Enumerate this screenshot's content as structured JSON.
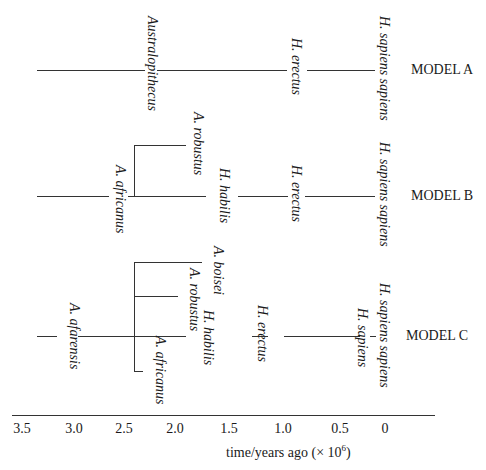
{
  "models": {
    "a": {
      "label": "MODEL A",
      "species": [
        "Australopithecus",
        "H. erectus",
        "H. sapiens sapiens"
      ]
    },
    "b": {
      "label": "MODEL B",
      "species": [
        "A. robustus",
        "A. africanus",
        "H. habilis",
        "H. erectus",
        "H. sapiens sapiens"
      ]
    },
    "c": {
      "label": "MODEL C",
      "species": [
        "A. afarensis",
        "A. boisei",
        "A. robustus",
        "A. africanus",
        "H. habilis",
        "H. erectus",
        "H. sapiens",
        "H. sapiens sapiens"
      ]
    }
  },
  "axis": {
    "ticks": [
      "3.5",
      "3.0",
      "2.5",
      "2.0",
      "1.5",
      "1.0",
      "0.5",
      "0"
    ],
    "title_prefix": "time/years ago (× 10",
    "title_exp": "6",
    "title_suffix": ")"
  }
}
